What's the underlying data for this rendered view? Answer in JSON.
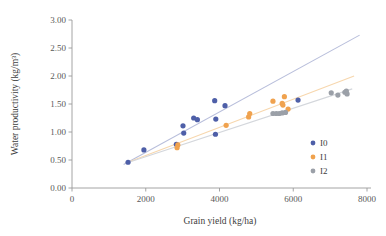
{
  "chart_data": {
    "type": "scatter",
    "title": "",
    "xlabel": "Grain yield (kg/ha)",
    "ylabel": "Water productivity (kg/m³)",
    "xlim": [
      0,
      8000
    ],
    "ylim": [
      0,
      3.0
    ],
    "xticks": [
      "0",
      "2000",
      "4000",
      "6000",
      "8000"
    ],
    "xtick_values": [
      0,
      2000,
      4000,
      6000,
      8000
    ],
    "yticks": [
      "0.00",
      "0.50",
      "1.00",
      "1.50",
      "2.00",
      "2.50",
      "3.00"
    ],
    "ytick_values": [
      0,
      0.5,
      1.0,
      1.5,
      2.0,
      2.5,
      3.0
    ],
    "grid": false,
    "legend_position": "right-inside",
    "series": [
      {
        "name": "I0",
        "color": "#4E5FA8",
        "marker": "circle",
        "points": [
          [
            1520,
            0.46
          ],
          [
            1950,
            0.68
          ],
          [
            2830,
            0.78
          ],
          [
            3010,
            1.11
          ],
          [
            3030,
            0.98
          ],
          [
            3300,
            1.25
          ],
          [
            3400,
            1.22
          ],
          [
            3870,
            1.56
          ],
          [
            3890,
            0.96
          ],
          [
            3900,
            1.23
          ],
          [
            4150,
            1.47
          ],
          [
            6130,
            1.57
          ]
        ],
        "trendline": {
          "x0": 1400,
          "y0": 0.42,
          "x1": 7800,
          "y1": 2.73,
          "color": "#B8BEDB"
        }
      },
      {
        "name": "I1",
        "color": "#F0A24E",
        "marker": "circle",
        "points": [
          [
            2850,
            0.72
          ],
          [
            2870,
            0.77
          ],
          [
            4180,
            1.12
          ],
          [
            4790,
            1.27
          ],
          [
            4820,
            1.33
          ],
          [
            5450,
            1.55
          ],
          [
            5700,
            1.51
          ],
          [
            5720,
            1.48
          ],
          [
            5760,
            1.63
          ],
          [
            5860,
            1.41
          ]
        ],
        "trendline": {
          "x0": 1450,
          "y0": 0.44,
          "x1": 7650,
          "y1": 2.0,
          "color": "#F7D7AE"
        }
      },
      {
        "name": "I2",
        "color": "#9BA0A8",
        "marker": "circle",
        "points": [
          [
            5450,
            1.33
          ],
          [
            5540,
            1.33
          ],
          [
            5620,
            1.33
          ],
          [
            5700,
            1.34
          ],
          [
            5790,
            1.35
          ],
          [
            7030,
            1.7
          ],
          [
            7210,
            1.66
          ],
          [
            7400,
            1.71
          ],
          [
            7440,
            1.73
          ],
          [
            7460,
            1.68
          ]
        ],
        "trendline": {
          "x0": 1500,
          "y0": 0.45,
          "x1": 7600,
          "y1": 1.77,
          "color": "#D4D7DC"
        }
      }
    ]
  },
  "legend": {
    "items": [
      {
        "label": "I0",
        "color": "#4E5FA8"
      },
      {
        "label": "I1",
        "color": "#F0A24E"
      },
      {
        "label": "I2",
        "color": "#9BA0A8"
      }
    ]
  }
}
